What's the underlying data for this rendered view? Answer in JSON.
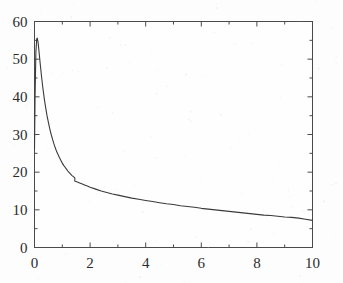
{
  "figure": {
    "background_color": "#fdfdfd",
    "line_color": "#3a3a3a",
    "axis_color": "#4a4a4a",
    "text_color": "#2b2b2b"
  },
  "axes": {
    "x_ticks": [
      "0",
      "2",
      "4",
      "6",
      "8",
      "10"
    ],
    "y_ticks": [
      "0",
      "10",
      "20",
      "30",
      "40",
      "50",
      "60"
    ]
  },
  "chart_data": {
    "type": "line",
    "title": "",
    "subtitle": "",
    "xlabel": "",
    "ylabel": "",
    "xlim": [
      0,
      10
    ],
    "ylim": [
      0,
      60
    ],
    "grid": false,
    "legend": null,
    "xticks": [
      0,
      2,
      4,
      6,
      8,
      10
    ],
    "yticks": [
      0,
      10,
      20,
      30,
      40,
      50,
      60
    ],
    "x_minor_ticks": [
      1,
      3,
      5,
      7,
      9
    ],
    "y_minor_ticks": [
      5,
      15,
      25,
      35,
      45,
      55
    ],
    "annotations": [
      {
        "text": "kink / slope discontinuity",
        "x": 1.45,
        "y": 17.5
      }
    ],
    "series": [
      {
        "name": "decay curve",
        "color": "#3a3a3a",
        "linewidth": 1.1,
        "x": [
          0.0,
          0.02,
          0.05,
          0.08,
          0.1,
          0.13,
          0.16,
          0.2,
          0.25,
          0.3,
          0.35,
          0.4,
          0.45,
          0.5,
          0.55,
          0.6,
          0.65,
          0.7,
          0.75,
          0.8,
          0.85,
          0.9,
          0.95,
          1.0,
          1.05,
          1.1,
          1.15,
          1.2,
          1.25,
          1.3,
          1.35,
          1.4,
          1.45,
          1.45,
          1.5,
          1.6,
          1.7,
          1.8,
          1.9,
          2.0,
          2.2,
          2.4,
          2.6,
          2.8,
          3.0,
          3.25,
          3.5,
          3.75,
          4.0,
          4.25,
          4.5,
          4.75,
          5.0,
          5.25,
          5.5,
          5.75,
          6.0,
          6.25,
          6.5,
          6.75,
          7.0,
          7.25,
          7.5,
          7.75,
          8.0,
          8.25,
          8.5,
          8.75,
          9.0,
          9.25,
          9.5,
          9.75,
          10.0
        ],
        "y": [
          26.0,
          40.0,
          52.0,
          55.4,
          55.6,
          54.4,
          52.2,
          49.2,
          45.6,
          42.4,
          39.6,
          37.2,
          35.0,
          33.2,
          31.5,
          30.0,
          28.7,
          27.5,
          26.4,
          25.4,
          24.6,
          23.8,
          23.1,
          22.4,
          21.8,
          21.3,
          20.8,
          20.3,
          19.9,
          19.5,
          19.1,
          18.8,
          18.5,
          17.6,
          17.5,
          17.2,
          16.9,
          16.6,
          16.3,
          16.0,
          15.5,
          15.0,
          14.6,
          14.2,
          13.9,
          13.5,
          13.1,
          12.8,
          12.5,
          12.2,
          11.9,
          11.6,
          11.4,
          11.1,
          10.9,
          10.7,
          10.4,
          10.2,
          10.0,
          9.8,
          9.6,
          9.4,
          9.2,
          9.0,
          8.8,
          8.6,
          8.5,
          8.3,
          8.1,
          8.0,
          7.8,
          7.5,
          7.2
        ]
      }
    ]
  }
}
